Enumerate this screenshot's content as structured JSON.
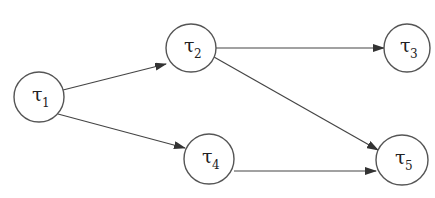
{
  "diagram": {
    "type": "directed-task-graph",
    "nodes": [
      {
        "id": "t1",
        "symbol": "τ",
        "subscript": "1",
        "cx": 39,
        "cy": 97,
        "rx": 25,
        "ry": 25
      },
      {
        "id": "t2",
        "symbol": "τ",
        "subscript": "2",
        "cx": 191,
        "cy": 48,
        "rx": 25,
        "ry": 24
      },
      {
        "id": "t3",
        "symbol": "τ",
        "subscript": "3",
        "cx": 407,
        "cy": 48,
        "rx": 23,
        "ry": 24
      },
      {
        "id": "t4",
        "symbol": "τ",
        "subscript": "4",
        "cx": 209,
        "cy": 159,
        "rx": 25,
        "ry": 25
      },
      {
        "id": "t5",
        "symbol": "τ",
        "subscript": "5",
        "cx": 402,
        "cy": 160,
        "rx": 26,
        "ry": 25
      }
    ],
    "edges": [
      {
        "from": "t1",
        "to": "t2",
        "x1": 63,
        "y1": 90,
        "x2": 166,
        "y2": 64
      },
      {
        "from": "t1",
        "to": "t4",
        "x1": 58,
        "y1": 114,
        "x2": 185,
        "y2": 148
      },
      {
        "from": "t2",
        "to": "t3",
        "x1": 216,
        "y1": 48,
        "x2": 384,
        "y2": 48
      },
      {
        "from": "t2",
        "to": "t5",
        "x1": 214,
        "y1": 57,
        "x2": 378,
        "y2": 150
      },
      {
        "from": "t4",
        "to": "t5",
        "x1": 234,
        "y1": 171,
        "x2": 376,
        "y2": 171
      }
    ],
    "colors": {
      "stroke": "#555555",
      "edge": "#444444",
      "text": "#222222",
      "background": "#ffffff"
    }
  },
  "labels": {
    "t1": {
      "symbol": "τ",
      "sub": "1"
    },
    "t2": {
      "symbol": "τ",
      "sub": "2"
    },
    "t3": {
      "symbol": "τ",
      "sub": "3"
    },
    "t4": {
      "symbol": "τ",
      "sub": "4"
    },
    "t5": {
      "symbol": "τ",
      "sub": "5"
    }
  }
}
